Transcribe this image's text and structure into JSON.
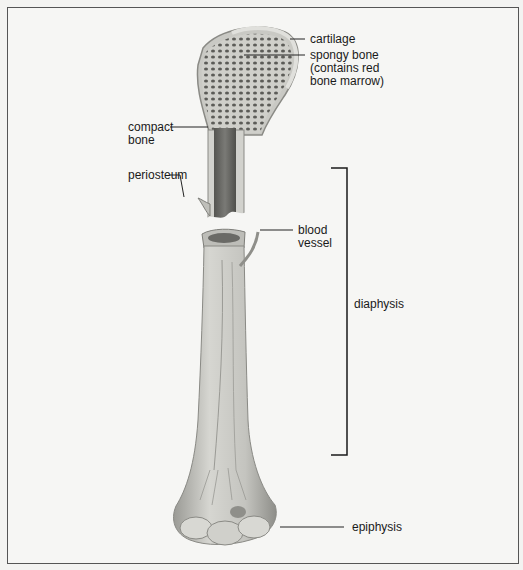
{
  "figure": {
    "labels": {
      "cartilage": "cartilage",
      "spongy_bone": "spongy bone\n(contains red\nbone marrow)",
      "compact_bone": "compact\nbone",
      "periosteum": "periosteum",
      "blood_vessel": "blood\nvessel",
      "diaphysis": "diaphysis",
      "epiphysis": "epiphysis"
    },
    "colors": {
      "background": "#f3f3f1",
      "frame": "#555555",
      "bone_light": "#d8d8d4",
      "bone_mid": "#b9b9b4",
      "marrow_dark": "#6e6e6a",
      "leader_line": "#222222"
    }
  }
}
